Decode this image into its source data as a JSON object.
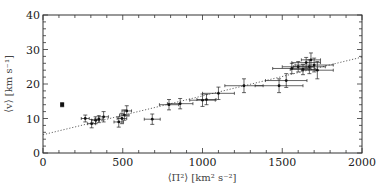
{
  "chart_data": {
    "type": "scatter",
    "title": "",
    "xlabel": "⟨Π²⟩ [km² s⁻²]",
    "ylabel": "⟨v⟩ [km s⁻¹]",
    "xlim": [
      0,
      2000
    ],
    "ylim": [
      0,
      40
    ],
    "x_ticks": [
      0,
      500,
      1000,
      1500,
      2000
    ],
    "y_ticks": [
      0,
      10,
      20,
      30,
      40
    ],
    "x_minor_step": 100,
    "y_minor_step": 2,
    "grid": false,
    "legend": null,
    "series": [
      {
        "name": "data",
        "marker": "point with error bars",
        "points": [
          {
            "x": 120,
            "y": 14.0,
            "xerr": 0,
            "yerr": 0.6,
            "marker": "square"
          },
          {
            "x": 265,
            "y": 10.0,
            "xerr": 25,
            "yerr": 1.0
          },
          {
            "x": 305,
            "y": 8.5,
            "xerr": 25,
            "yerr": 1.2
          },
          {
            "x": 330,
            "y": 9.5,
            "xerr": 25,
            "yerr": 1.0
          },
          {
            "x": 350,
            "y": 9.8,
            "xerr": 25,
            "yerr": 1.0
          },
          {
            "x": 380,
            "y": 10.5,
            "xerr": 30,
            "yerr": 1.5
          },
          {
            "x": 475,
            "y": 9.0,
            "xerr": 30,
            "yerr": 1.5
          },
          {
            "x": 495,
            "y": 10.0,
            "xerr": 30,
            "yerr": 1.5
          },
          {
            "x": 510,
            "y": 11.0,
            "xerr": 30,
            "yerr": 1.5
          },
          {
            "x": 525,
            "y": 12.2,
            "xerr": 30,
            "yerr": 1.5
          },
          {
            "x": 685,
            "y": 9.8,
            "xerr": 50,
            "yerr": 1.5
          },
          {
            "x": 790,
            "y": 14.0,
            "xerr": 60,
            "yerr": 1.5
          },
          {
            "x": 860,
            "y": 14.3,
            "xerr": 80,
            "yerr": 1.5
          },
          {
            "x": 1000,
            "y": 15.3,
            "xerr": 80,
            "yerr": 1.8
          },
          {
            "x": 1025,
            "y": 15.5,
            "xerr": 60,
            "yerr": 1.5
          },
          {
            "x": 1100,
            "y": 17.3,
            "xerr": 100,
            "yerr": 1.8
          },
          {
            "x": 1260,
            "y": 19.5,
            "xerr": 120,
            "yerr": 2.0
          },
          {
            "x": 1480,
            "y": 19.5,
            "xerr": 150,
            "yerr": 2.0
          },
          {
            "x": 1525,
            "y": 21.0,
            "xerr": 130,
            "yerr": 2.0
          },
          {
            "x": 1560,
            "y": 24.5,
            "xerr": 120,
            "yerr": 1.5
          },
          {
            "x": 1600,
            "y": 25.0,
            "xerr": 100,
            "yerr": 1.5
          },
          {
            "x": 1630,
            "y": 24.2,
            "xerr": 80,
            "yerr": 1.5
          },
          {
            "x": 1650,
            "y": 26.2,
            "xerr": 90,
            "yerr": 1.5
          },
          {
            "x": 1670,
            "y": 25.0,
            "xerr": 100,
            "yerr": 2.0
          },
          {
            "x": 1680,
            "y": 27.0,
            "xerr": 60,
            "yerr": 2.0
          },
          {
            "x": 1700,
            "y": 25.5,
            "xerr": 120,
            "yerr": 2.0
          },
          {
            "x": 1720,
            "y": 24.0,
            "xerr": 100,
            "yerr": 2.5
          }
        ]
      }
    ],
    "fit_line": {
      "style": "dotted",
      "x": [
        0,
        2000
      ],
      "y": [
        5.3,
        27.8
      ]
    }
  }
}
